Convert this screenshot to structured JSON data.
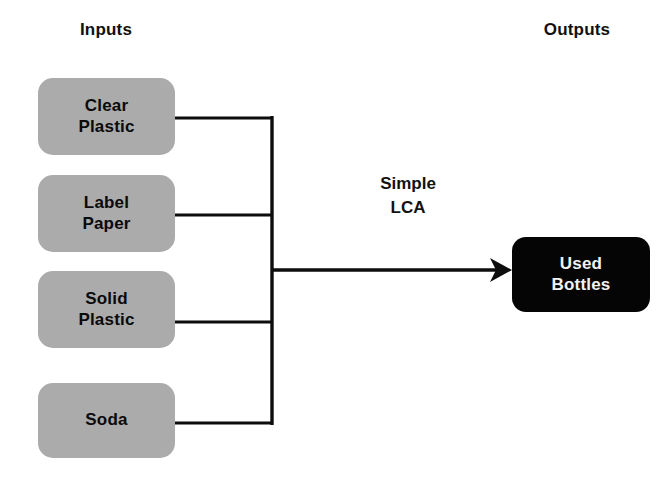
{
  "headings": {
    "inputs": "Inputs",
    "outputs": "Outputs"
  },
  "process": {
    "line1": "Simple",
    "line2": "LCA"
  },
  "inputs": [
    {
      "line1": "Clear",
      "line2": "Plastic"
    },
    {
      "line1": "Label",
      "line2": "Paper"
    },
    {
      "line1": "Solid",
      "line2": "Plastic"
    },
    {
      "line1": "Soda",
      "line2": ""
    }
  ],
  "outputs": [
    {
      "line1": "Used",
      "line2": "Bottles"
    }
  ],
  "colors": {
    "input_box_fill": "#ababab",
    "input_box_text": "#0a0a0a",
    "output_box_fill": "#050505",
    "output_box_text": "#f2f2f2",
    "connector": "#0d0d0d",
    "background": "#ffffff"
  }
}
